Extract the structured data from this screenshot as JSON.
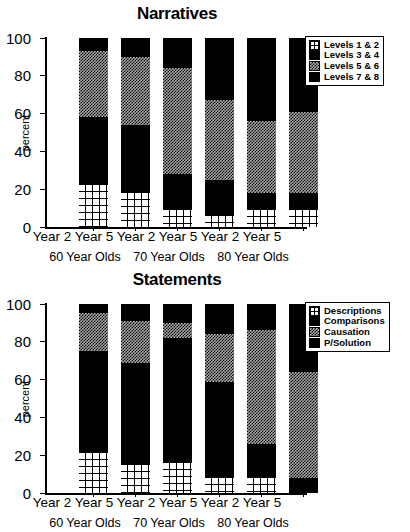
{
  "chart_data": [
    {
      "type": "bar",
      "stacked": true,
      "title": "Narratives",
      "xlabel": "",
      "ylabel": "percent",
      "ylim": [
        0,
        100
      ],
      "yticks": [
        0,
        20,
        40,
        60,
        80,
        100
      ],
      "grid": false,
      "legend_position": "top-right",
      "categories": [
        "Year 2",
        "Year 5",
        "Year 2",
        "Year 5",
        "Year 2",
        "Year 5"
      ],
      "groups": [
        "60 Year Olds",
        "70 Year Olds",
        "80 Year Olds"
      ],
      "series": [
        {
          "name": "Levels 1 & 2",
          "fill": "grid",
          "values": [
            22,
            18,
            9,
            6,
            9,
            9
          ]
        },
        {
          "name": "Levels 3 & 4",
          "fill": "solid",
          "values": [
            36,
            36,
            19,
            19,
            9,
            9
          ]
        },
        {
          "name": "Levels 5 & 6",
          "fill": "gray",
          "values": [
            35,
            36,
            56,
            42,
            38,
            43
          ]
        },
        {
          "name": "Levels 7 & 8",
          "fill": "dark",
          "values": [
            7,
            10,
            16,
            33,
            44,
            39
          ]
        }
      ]
    },
    {
      "type": "bar",
      "stacked": true,
      "title": "Statements",
      "xlabel": "",
      "ylabel": "percent",
      "ylim": [
        0,
        100
      ],
      "yticks": [
        0,
        20,
        40,
        60,
        80,
        100
      ],
      "grid": false,
      "legend_position": "top-right",
      "categories": [
        "Year 2",
        "Year 5",
        "Year 2",
        "Year 5",
        "Year 2",
        "Year 5"
      ],
      "groups": [
        "60 Year Olds",
        "70 Year Olds",
        "80 Year Olds"
      ],
      "series": [
        {
          "name": "Descriptions",
          "fill": "grid",
          "values": [
            21,
            15,
            16,
            8,
            8,
            0
          ]
        },
        {
          "name": "Comparisons",
          "fill": "solid",
          "values": [
            54,
            54,
            66,
            51,
            18,
            8
          ]
        },
        {
          "name": "Causation",
          "fill": "gray",
          "values": [
            20,
            22,
            8,
            25,
            60,
            56
          ]
        },
        {
          "name": "P/Solution",
          "fill": "dark",
          "values": [
            5,
            9,
            10,
            16,
            14,
            36
          ]
        }
      ]
    }
  ]
}
